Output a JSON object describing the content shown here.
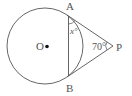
{
  "diagram": {
    "type": "geometry",
    "points": {
      "O": {
        "label": "O"
      },
      "A": {
        "label": "A"
      },
      "B": {
        "label": "B"
      },
      "P": {
        "label": "P"
      }
    },
    "angles": {
      "P": {
        "label": "70°",
        "value": 70
      },
      "x": {
        "label": "x°",
        "at": "A",
        "between": [
          "AB",
          "AP"
        ]
      }
    },
    "colors": {
      "stroke": "#555555",
      "center_dot": "#111111"
    }
  }
}
